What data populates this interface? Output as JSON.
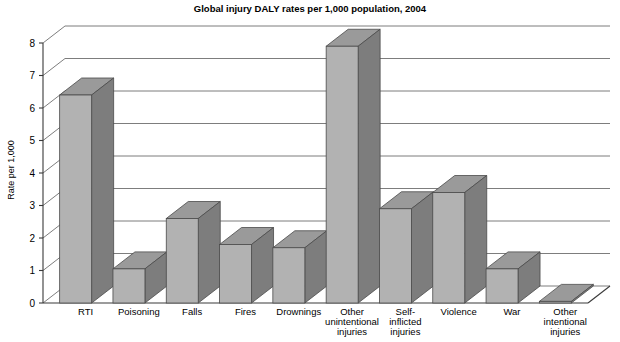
{
  "chart_data": {
    "type": "bar",
    "title": "Global injury DALY rates per 1,000 population, 2004",
    "xlabel": "",
    "ylabel": "Rate per 1,000",
    "ylim": [
      0,
      8
    ],
    "yticks": [
      0,
      1,
      2,
      3,
      4,
      5,
      6,
      7,
      8
    ],
    "ytick_labels": [
      "0",
      "1",
      "2",
      "3",
      "4",
      "5",
      "6",
      "7",
      "8"
    ],
    "grid": true,
    "legend": null,
    "style": "3d-bar",
    "categories": [
      "RTI",
      "Poisoning",
      "Falls",
      "Fires",
      "Drownings",
      "Other unintentional injuries",
      "Self-inflicted injuries",
      "Violence",
      "War",
      "Other intentional injuries"
    ],
    "category_label_lines": [
      [
        "RTI"
      ],
      [
        "Poisoning"
      ],
      [
        "Falls"
      ],
      [
        "Fires"
      ],
      [
        "Drownings"
      ],
      [
        "Other",
        "unintentional",
        "injuries"
      ],
      [
        "Self-",
        "inflicted",
        "injuries"
      ],
      [
        "Violence"
      ],
      [
        "War"
      ],
      [
        "Other",
        "intentional",
        "injuries"
      ]
    ],
    "values": [
      6.4,
      1.05,
      2.6,
      1.8,
      1.7,
      7.9,
      2.9,
      3.4,
      1.05,
      0.05
    ],
    "series": [
      {
        "name": "Rate per 1,000",
        "values": [
          6.4,
          1.05,
          2.6,
          1.8,
          1.7,
          7.9,
          2.9,
          3.4,
          1.05,
          0.05
        ]
      }
    ]
  },
  "colors": {
    "bar_front": "#b2b2b2",
    "bar_side": "#7d7d7d",
    "bar_top": "#9a9a9a",
    "bar_outline": "#4a4a4a",
    "gridline": "#6e6e6e",
    "axis": "#3a3a3a",
    "background": "#ffffff",
    "text": "#000000"
  },
  "labels": {
    "title": "Global injury DALY rates per 1,000 population, 2004",
    "y_axis_title": "Rate per 1,000"
  }
}
